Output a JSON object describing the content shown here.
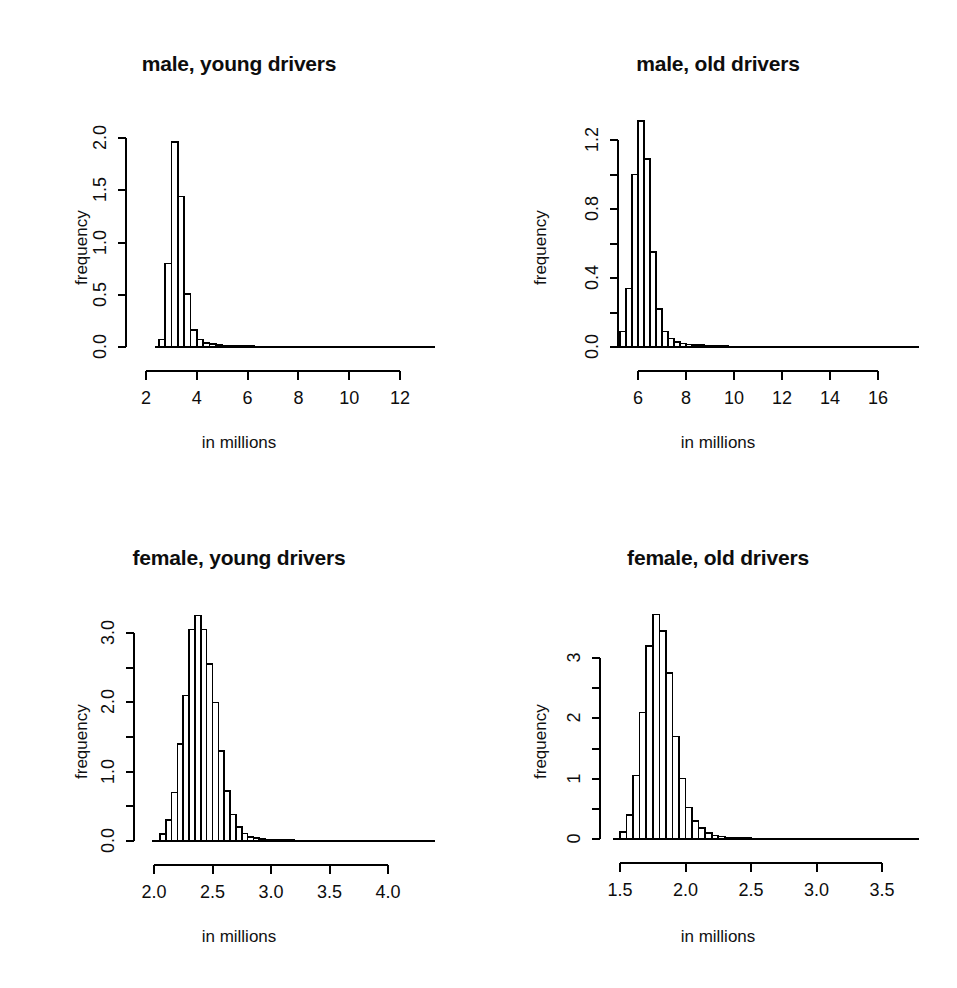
{
  "figure": {
    "background": "#ffffff",
    "line_color": "#000000",
    "bar_fill": "#ffffff",
    "layout": "2x2 grid of histograms"
  },
  "panels": [
    {
      "key": "male_young",
      "title": "male, young drivers",
      "xlabel": "in millions",
      "ylabel": "frequency"
    },
    {
      "key": "male_old",
      "title": "male, old drivers",
      "xlabel": "in millions",
      "ylabel": "frequency"
    },
    {
      "key": "female_young",
      "title": "female, young drivers",
      "xlabel": "in millions",
      "ylabel": "frequency"
    },
    {
      "key": "female_old",
      "title": "female, old drivers",
      "xlabel": "in millions",
      "ylabel": "frequency"
    }
  ],
  "chart_data": [
    {
      "type": "bar",
      "subtype": "histogram",
      "title": "male, young drivers",
      "xlabel": "in millions",
      "ylabel": "frequency",
      "xlim": [
        2.35,
        13.2
      ],
      "ylim": [
        0.0,
        2.05
      ],
      "xticks": [
        2,
        4,
        6,
        8,
        10,
        12
      ],
      "xtick_labels": [
        "2",
        "4",
        "6",
        "8",
        "10",
        "12"
      ],
      "yticks": [
        0.0,
        0.5,
        1.0,
        1.5,
        2.0
      ],
      "ytick_labels": [
        "0.0",
        "0.5",
        "1.0",
        "1.5",
        "2.0"
      ],
      "ytick_minor": [],
      "grid": false,
      "legend": false,
      "bin_width": 0.25,
      "bin_starts": [
        2.5,
        2.75,
        3.0,
        3.25,
        3.5,
        3.75,
        4.0,
        4.25,
        4.5,
        4.75,
        5.0,
        5.25,
        5.5,
        5.75,
        6.0,
        6.25,
        6.5,
        6.75,
        7.0,
        7.25,
        7.5,
        7.75,
        8.0,
        8.25,
        8.5,
        8.75,
        9.0,
        9.25,
        9.5,
        9.75,
        10.0,
        10.25,
        10.5,
        10.75,
        11.0,
        11.25,
        11.5,
        11.75,
        12.0,
        12.25,
        12.5,
        12.75
      ],
      "values": [
        0.07,
        0.8,
        1.96,
        1.44,
        0.51,
        0.16,
        0.07,
        0.04,
        0.03,
        0.02,
        0.015,
        0.012,
        0.01,
        0.008,
        0.007,
        0.006,
        0.005,
        0.004,
        0.004,
        0.003,
        0.003,
        0.002,
        0.002,
        0.002,
        0.002,
        0.001,
        0.001,
        0.001,
        0.001,
        0.001,
        0.001,
        0.001,
        0.001,
        0.001,
        0.001,
        0.001,
        0.001,
        0.001,
        0.001,
        0.001,
        0.001,
        0.001
      ]
    },
    {
      "type": "bar",
      "subtype": "histogram",
      "title": "male, old drivers",
      "xlabel": "in millions",
      "ylabel": "frequency",
      "xlim": [
        5.0,
        16.6
      ],
      "ylim": [
        0.0,
        1.35
      ],
      "xticks": [
        6,
        8,
        10,
        12,
        14,
        16
      ],
      "xtick_labels": [
        "6",
        "8",
        "10",
        "12",
        "14",
        "16"
      ],
      "yticks": [
        0.0,
        0.4,
        0.8,
        1.2
      ],
      "ytick_labels": [
        "0.0",
        "0.4",
        "0.8",
        "1.2"
      ],
      "ytick_minor": [
        0.2,
        0.6,
        1.0
      ],
      "grid": false,
      "legend": false,
      "bin_width": 0.25,
      "bin_starts": [
        5.25,
        5.5,
        5.75,
        6.0,
        6.25,
        6.5,
        6.75,
        7.0,
        7.25,
        7.5,
        7.75,
        8.0,
        8.25,
        8.5,
        8.75,
        9.0,
        9.25,
        9.5,
        9.75,
        10.0,
        10.5,
        11.0,
        11.5,
        12.0,
        12.5,
        13.0,
        13.5,
        14.0,
        14.5,
        15.0,
        15.5,
        16.0
      ],
      "values": [
        0.09,
        0.34,
        1.0,
        1.31,
        1.09,
        0.55,
        0.22,
        0.09,
        0.05,
        0.03,
        0.02,
        0.015,
        0.012,
        0.01,
        0.008,
        0.007,
        0.006,
        0.005,
        0.004,
        0.004,
        0.003,
        0.003,
        0.002,
        0.002,
        0.002,
        0.002,
        0.001,
        0.001,
        0.001,
        0.001,
        0.001,
        0.001
      ]
    },
    {
      "type": "bar",
      "subtype": "histogram",
      "title": "female, young drivers",
      "xlabel": "in millions",
      "ylabel": "frequency",
      "xlim": [
        1.98,
        4.28
      ],
      "ylim": [
        0.0,
        3.35
      ],
      "xticks": [
        2.0,
        2.5,
        3.0,
        3.5,
        4.0
      ],
      "xtick_labels": [
        "2.0",
        "2.5",
        "3.0",
        "3.5",
        "4.0"
      ],
      "yticks": [
        0.0,
        1.0,
        2.0,
        3.0
      ],
      "ytick_labels": [
        "0.0",
        "1.0",
        "2.0",
        "3.0"
      ],
      "ytick_minor": [
        0.5,
        1.5,
        2.5
      ],
      "grid": false,
      "legend": false,
      "bin_width": 0.05,
      "bin_starts": [
        2.05,
        2.1,
        2.15,
        2.2,
        2.25,
        2.3,
        2.35,
        2.4,
        2.45,
        2.5,
        2.55,
        2.6,
        2.65,
        2.7,
        2.75,
        2.8,
        2.85,
        2.9,
        2.95,
        3.0,
        3.1,
        3.2,
        3.3,
        3.4,
        3.5,
        3.6,
        3.7,
        3.8,
        3.9,
        4.0,
        4.1,
        4.2
      ],
      "values": [
        0.1,
        0.3,
        0.7,
        1.4,
        2.1,
        3.05,
        3.25,
        3.05,
        2.55,
        2.0,
        1.3,
        0.72,
        0.38,
        0.2,
        0.11,
        0.06,
        0.04,
        0.03,
        0.02,
        0.015,
        0.012,
        0.01,
        0.008,
        0.006,
        0.005,
        0.004,
        0.003,
        0.003,
        0.002,
        0.002,
        0.001,
        0.001
      ]
    },
    {
      "type": "bar",
      "subtype": "histogram",
      "title": "female, old drivers",
      "xlabel": "in millions",
      "ylabel": "frequency",
      "xlim": [
        1.45,
        3.55
      ],
      "ylim": [
        0.0,
        3.75
      ],
      "xticks": [
        1.5,
        2.0,
        2.5,
        3.0,
        3.5
      ],
      "xtick_labels": [
        "1.5",
        "2.0",
        "2.5",
        "3.0",
        "3.5"
      ],
      "yticks": [
        0,
        1,
        2,
        3
      ],
      "ytick_labels": [
        "0",
        "1",
        "2",
        "3"
      ],
      "ytick_minor": [
        0.5,
        1.5,
        2.5
      ],
      "grid": false,
      "legend": false,
      "bin_width": 0.05,
      "bin_starts": [
        1.5,
        1.55,
        1.6,
        1.65,
        1.7,
        1.75,
        1.8,
        1.85,
        1.9,
        1.95,
        2.0,
        2.05,
        2.1,
        2.15,
        2.2,
        2.25,
        2.3,
        2.35,
        2.4,
        2.45,
        2.5,
        2.6,
        2.7,
        2.8,
        2.9,
        3.0,
        3.1,
        3.2,
        3.3,
        3.4
      ],
      "values": [
        0.12,
        0.4,
        1.05,
        2.1,
        3.2,
        3.72,
        3.45,
        2.75,
        1.7,
        1.0,
        0.52,
        0.3,
        0.18,
        0.1,
        0.06,
        0.04,
        0.025,
        0.02,
        0.015,
        0.012,
        0.01,
        0.008,
        0.006,
        0.005,
        0.004,
        0.003,
        0.003,
        0.002,
        0.002,
        0.001
      ]
    }
  ]
}
